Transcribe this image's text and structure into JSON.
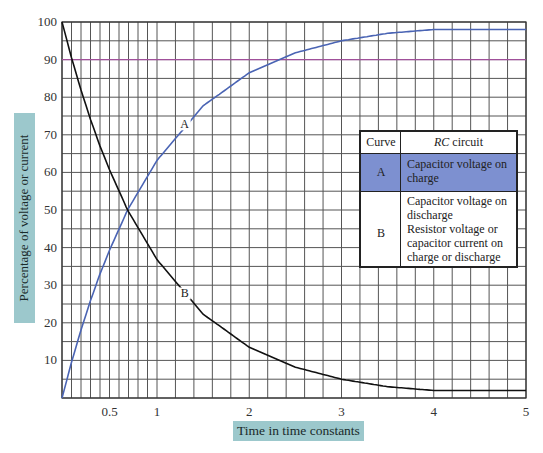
{
  "chart_data": {
    "type": "line",
    "title": "",
    "xlabel": "Time in time constants",
    "ylabel": "Percentage of voltage or current",
    "xlim": [
      0,
      5
    ],
    "ylim": [
      0,
      100
    ],
    "x_ticks": [
      {
        "value": 0.5,
        "label": "0.5"
      },
      {
        "value": 1,
        "label": "1"
      },
      {
        "value": 2,
        "label": "2"
      },
      {
        "value": 3,
        "label": "3"
      },
      {
        "value": 4,
        "label": "4"
      },
      {
        "value": 5,
        "label": "5"
      }
    ],
    "y_ticks": [
      {
        "value": 10,
        "label": "10"
      },
      {
        "value": 20,
        "label": "20"
      },
      {
        "value": 30,
        "label": "30"
      },
      {
        "value": 40,
        "label": "40"
      },
      {
        "value": 50,
        "label": "50"
      },
      {
        "value": 60,
        "label": "60"
      },
      {
        "value": 70,
        "label": "70"
      },
      {
        "value": 80,
        "label": "80"
      },
      {
        "value": 90,
        "label": "90"
      },
      {
        "value": 100,
        "label": "100"
      }
    ],
    "grid": {
      "on": true,
      "x_minor_step_0_to_1": 0.1,
      "x_minor_step_1_to_5": 0.2,
      "y_step": 5
    },
    "reference_lines": [
      {
        "axis": "y",
        "value": 90,
        "color": "#a0509a"
      }
    ],
    "series": [
      {
        "name": "A",
        "description": "Capacitor voltage on charge",
        "color": "#4a64b4",
        "label_at": {
          "x": 1.3,
          "y": 72
        },
        "x": [
          0,
          0.1,
          0.2,
          0.3,
          0.4,
          0.5,
          0.69,
          1,
          1.5,
          2,
          2.5,
          3,
          3.5,
          4,
          4.5,
          5
        ],
        "y": [
          0,
          9.5,
          18.1,
          25.9,
          33,
          39.3,
          50,
          63.2,
          77.7,
          86.5,
          91.8,
          95,
          97,
          98,
          98,
          98
        ]
      },
      {
        "name": "B",
        "description": "Capacitor voltage on discharge; Resistor voltage or capacitor current on charge or discharge",
        "color": "#111111",
        "label_at": {
          "x": 1.3,
          "y": 27
        },
        "x": [
          0,
          0.1,
          0.2,
          0.3,
          0.4,
          0.5,
          0.69,
          1,
          1.5,
          2,
          2.5,
          3,
          3.5,
          4,
          4.5,
          5
        ],
        "y": [
          100,
          90.5,
          81.9,
          74.1,
          67,
          60.7,
          50,
          36.8,
          22.3,
          13.5,
          8.2,
          5,
          3,
          2,
          2,
          2
        ]
      }
    ],
    "legend": {
      "position": "right-center, inside plot",
      "header": {
        "curve": "Curve",
        "rc_italic": "RC",
        "rc_rest": " circuit"
      },
      "rows": [
        {
          "curve": "A",
          "lines": [
            "Capacitor voltage on charge"
          ],
          "highlight": "#7d90d0"
        },
        {
          "curve": "B",
          "lines": [
            "Capacitor voltage on discharge",
            "Resistor voltage or capacitor current on charge or discharge"
          ]
        }
      ]
    }
  },
  "axis": {
    "xlabel": "Time in time constants",
    "ylabel": "Percentage of voltage or current"
  },
  "legend": {
    "header_curve": "Curve",
    "header_rc_italic": "RC",
    "header_rc_rest": " circuit",
    "row_a_id": "A",
    "row_a_desc": "Capacitor voltage on charge",
    "row_b_id": "B",
    "row_b_desc1": "Capacitor voltage on discharge",
    "row_b_desc2": "Resistor voltage or capacitor current on charge or discharge"
  },
  "colors": {
    "curve_a": "#4a64b4",
    "curve_b": "#111111",
    "ref_90": "#a0509a",
    "grid": "#555555",
    "label_box": "#9cc8cc",
    "legend_highlight": "#7d90d0"
  }
}
